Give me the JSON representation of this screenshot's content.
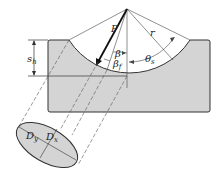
{
  "diagram": {
    "type": "wheel-rut / indentation cross-section",
    "colors": {
      "block_fill": "#d4d4d4",
      "stroke": "#333333",
      "background": "#ffffff"
    },
    "labels": {
      "force": "P",
      "beta": "β",
      "beta_f": "β",
      "beta_f_sub": "f",
      "theta": "θ",
      "theta_sub": "s",
      "radius": "r",
      "depth": "s",
      "depth_sub": "h",
      "dy": "D",
      "dy_sub": "y",
      "dx": "D",
      "dx_sub": "x"
    }
  }
}
